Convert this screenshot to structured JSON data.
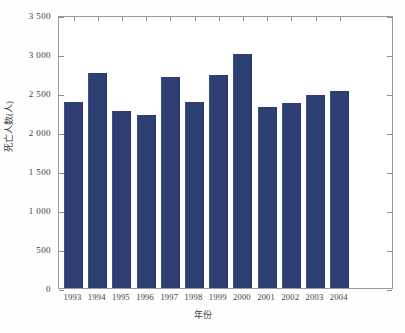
{
  "chart_data": {
    "type": "bar",
    "title": "",
    "subtitle": "",
    "xlabel": "年份",
    "ylabel": "死亡人数(人)",
    "categories": [
      "1993",
      "1994",
      "1995",
      "1996",
      "1997",
      "1998",
      "1999",
      "2000",
      "2001",
      "2002",
      "2003",
      "2004"
    ],
    "values": [
      2380,
      2760,
      2270,
      2220,
      2710,
      2380,
      2730,
      3000,
      2320,
      2370,
      2470,
      2530
    ],
    "series": [
      {
        "name": "死亡人数(人)",
        "values": [
          2380,
          2760,
          2270,
          2220,
          2710,
          2380,
          2730,
          3000,
          2320,
          2370,
          2470,
          2530
        ]
      }
    ],
    "ylim": [
      0,
      3500
    ],
    "yticks": [
      0,
      500,
      1000,
      1500,
      2000,
      2500,
      3000,
      3500
    ],
    "ytick_labels": [
      "0",
      "500",
      "1 000",
      "1 500",
      "2 000",
      "2 500",
      "3 000",
      "3 500"
    ],
    "grid": false,
    "legend": false,
    "legend_position": "none",
    "bar_color": "#2e3f73",
    "frame_color": "#9a9a9a",
    "background_color": "#ffffff"
  }
}
